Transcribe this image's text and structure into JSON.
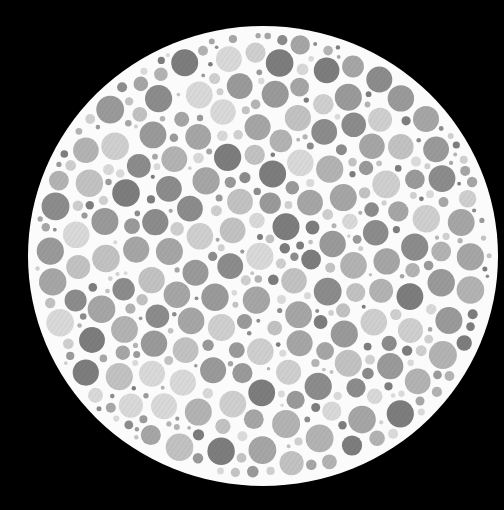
{
  "image": {
    "description": "Grayscale Ishihara-style color vision test plate: a white circular plate on a black background filled with randomly packed gray dots of varying size and tone; no figure is discernible in grayscale.",
    "width": 504,
    "height": 510
  },
  "colors": {
    "background": "#000000",
    "plate": "#fbfbfb",
    "dot_palette": [
      "#7d7d7d",
      "#8c8c8c",
      "#9a9a9a",
      "#a6a6a6",
      "#b3b3b3",
      "#c2c2c2",
      "#cfcfcf",
      "#d9d9d9"
    ]
  },
  "plate": {
    "cx": 263,
    "cy": 256,
    "rx": 235,
    "ry": 230
  },
  "dots": {
    "seed": 1337,
    "attempts": 9000,
    "min_r": 3,
    "max_r": 14,
    "gap": 2.2,
    "margin": 6,
    "hatch": true
  }
}
